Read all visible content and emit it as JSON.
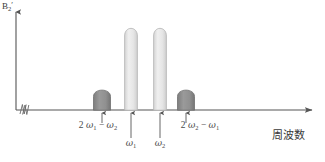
{
  "figure": {
    "kind": "spectrum-diagram",
    "background_color": "#ffffff",
    "axes": {
      "y_label": "B",
      "y_label_sub": "2",
      "y_label_prime": "′",
      "x_label": "周波数",
      "axis_color": "#555555",
      "y_axis_x": 16,
      "baseline_y": 110,
      "x_axis_start": 16,
      "x_axis_end": 318,
      "break_symbol": "axis-break-zigzag"
    },
    "annotations": [
      {
        "id": "peak-label-left",
        "text_parts": [
          "2 ",
          "ω",
          "1",
          " − ",
          "ω",
          "2"
        ],
        "plain": "2 ω1 − ω2",
        "x": 98,
        "y": 126,
        "row": "upper"
      },
      {
        "id": "peak-label-omega1",
        "text_parts": [
          "ω",
          "1"
        ],
        "plain": "ω1",
        "x": 131,
        "y": 143,
        "row": "lower"
      },
      {
        "id": "peak-label-omega2",
        "text_parts": [
          "ω",
          "2"
        ],
        "plain": "ω2",
        "x": 160,
        "y": 143,
        "row": "lower"
      },
      {
        "id": "peak-label-right",
        "text_parts": [
          "2 ",
          "ω",
          "2",
          " − ",
          "ω",
          "1"
        ],
        "plain": "2 ω2 − ω1",
        "x": 200,
        "y": 126,
        "row": "upper"
      }
    ],
    "peaks": [
      {
        "id": "sideband-left",
        "label": "2ω1−ω2",
        "center_x": 102,
        "width": 17,
        "top_y": 88,
        "fill": "#8c8c8c",
        "stroke": "#6e6e6e",
        "shape": "rounded-dome",
        "arrow_from_y": 122,
        "arrow_to_y": 112
      },
      {
        "id": "pump-omega1",
        "label": "ω1",
        "center_x": 131,
        "width": 13,
        "top_y": 27,
        "fill": "#e3e3e3",
        "stroke": "#b4b4b4",
        "shape": "tall-narrow-dome",
        "arrow_from_y": 139,
        "arrow_to_y": 112
      },
      {
        "id": "pump-omega2",
        "label": "ω2",
        "center_x": 160,
        "width": 13,
        "top_y": 27,
        "fill": "#e3e3e3",
        "stroke": "#b4b4b4",
        "shape": "tall-narrow-dome",
        "arrow_from_y": 139,
        "arrow_to_y": 112
      },
      {
        "id": "sideband-right",
        "label": "2ω2−ω1",
        "center_x": 186,
        "width": 17,
        "top_y": 88,
        "fill": "#8c8c8c",
        "stroke": "#6e6e6e",
        "shape": "rounded-dome",
        "arrow_from_y": 122,
        "arrow_to_y": 112
      }
    ]
  }
}
